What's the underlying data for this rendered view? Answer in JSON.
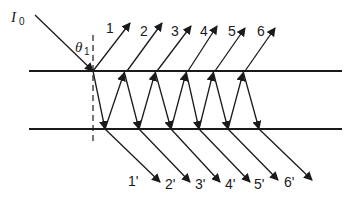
{
  "diagram": {
    "incident_label": {
      "symbol": "I",
      "subscript": "0"
    },
    "angle_label": {
      "symbol": "θ",
      "subscript": "1"
    },
    "reflected_labels": [
      "1",
      "2",
      "3",
      "4",
      "5",
      "6"
    ],
    "transmitted_labels": [
      "1'",
      "2'",
      "3'",
      "4'",
      "5'",
      "6'"
    ],
    "colors": {
      "ink": "#1a1a1a",
      "background": "#ffffff"
    }
  }
}
